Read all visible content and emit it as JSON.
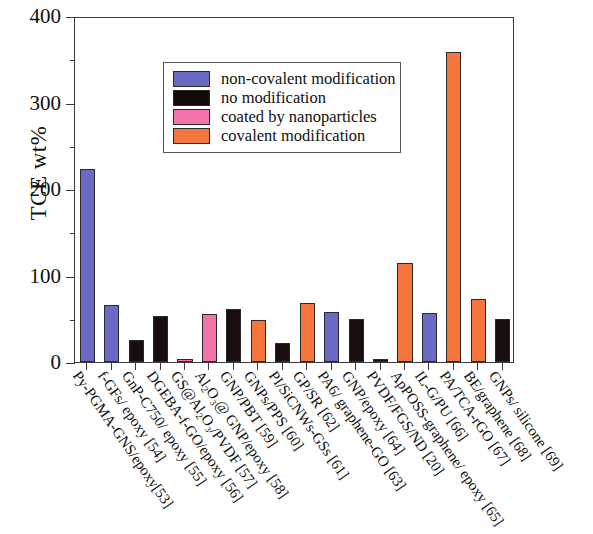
{
  "chart_data": {
    "type": "bar",
    "title": "",
    "xlabel": "",
    "ylabel": "TCE wt%",
    "ylim": [
      0,
      400
    ],
    "yticks": [
      0,
      100,
      200,
      300,
      400
    ],
    "ytick_labels": [
      "0",
      "100",
      "200",
      "300",
      "400"
    ],
    "grid": false,
    "legend_position": "upper-center",
    "categories": [
      "Py-PGMA-GNS/epoxy[53]",
      "f-GFs/ epoxy [54]",
      "GnP-C750/ epoxy [55]",
      "DGEBA-f-GO/epoxy [56]",
      "GS@Al2O3/PVDF [57]",
      "Al2O3@ GNP/epoxy [58]",
      "GNP/PBT [59]",
      "GNPs/PPS [60]",
      "PI/SiCNWs-GSs [61]",
      "GP/SR [62]",
      "PA6/ graphene-GO [63]",
      "GNP/epoxy [64]",
      "PVDF/FGS/ND [20]",
      "ApPOSS-graphene/ epoxy [65]",
      "IL-G/PU [66]",
      "PA/TCA-rGO [67]",
      "BE/graphene [68]",
      "GNPs/ silicone [69]"
    ],
    "bars": [
      {
        "label": "Py-PGMA-GNS/epoxy[53]",
        "value": 223,
        "group": "non-covalent modification"
      },
      {
        "label": "f-GFs/ epoxy [54]",
        "value": 66,
        "group": "non-covalent modification"
      },
      {
        "label": "GnP-C750/ epoxy [55]",
        "value": 25,
        "group": "no modification"
      },
      {
        "label": "DGEBA-f-GO/epoxy [56]",
        "value": 53,
        "group": "no modification"
      },
      {
        "label": "GS@Al2O3/PVDF [57]",
        "value": 4,
        "group": "coated by nanoparticles"
      },
      {
        "label": "Al2O3@ GNP/epoxy [58]",
        "value": 56,
        "group": "coated by nanoparticles"
      },
      {
        "label": "GNP/PBT [59]",
        "value": 61,
        "group": "no modification"
      },
      {
        "label": "GNPs/PPS [60]",
        "value": 49,
        "group": "covalent modification"
      },
      {
        "label": "PI/SiCNWs-GSs [61]",
        "value": 22,
        "group": "no modification"
      },
      {
        "label": "GP/SR [62]",
        "value": 68,
        "group": "covalent modification"
      },
      {
        "label": "PA6/ graphene-GO [63]",
        "value": 58,
        "group": "non-covalent modification"
      },
      {
        "label": "GNP/epoxy [64]",
        "value": 50,
        "group": "no modification"
      },
      {
        "label": "PVDF/FGS/ND [20]",
        "value": 4,
        "group": "no modification"
      },
      {
        "label": "ApPOSS-graphene/ epoxy [65]",
        "value": 115,
        "group": "covalent modification"
      },
      {
        "label": "IL-G/PU [66]",
        "value": 57,
        "group": "non-covalent modification"
      },
      {
        "label": "PA/TCA-rGO [67]",
        "value": 358,
        "group": "covalent modification"
      },
      {
        "label": "BE/graphene [68]",
        "value": 73,
        "group": "covalent modification"
      },
      {
        "label": "GNPs/ silicone [69]",
        "value": 50,
        "group": "no modification"
      }
    ],
    "series": [
      {
        "name": "non-covalent modification",
        "color": "#6a6ac4",
        "values": [
          223,
          66,
          null,
          null,
          null,
          null,
          null,
          null,
          null,
          null,
          58,
          null,
          null,
          null,
          57,
          null,
          null,
          null
        ]
      },
      {
        "name": "no modification",
        "color": "#1a0d0d",
        "values": [
          null,
          null,
          25,
          53,
          null,
          null,
          61,
          null,
          22,
          null,
          null,
          50,
          4,
          null,
          null,
          null,
          null,
          50
        ]
      },
      {
        "name": "coated by nanoparticles",
        "color": "#f573ab",
        "values": [
          null,
          null,
          null,
          null,
          4,
          56,
          null,
          null,
          null,
          null,
          null,
          null,
          null,
          null,
          null,
          null,
          null,
          null
        ]
      },
      {
        "name": "covalent modification",
        "color": "#f4763c",
        "values": [
          null,
          null,
          null,
          null,
          null,
          null,
          null,
          49,
          null,
          68,
          null,
          null,
          null,
          115,
          null,
          358,
          73,
          null
        ]
      }
    ]
  },
  "axis": {
    "ylabel": "TCE wt%",
    "ytick_labels": [
      "400",
      "300",
      "200",
      "100",
      "0"
    ]
  },
  "legend": {
    "items": [
      {
        "label": "non-covalent modification",
        "color": "#6a6ac4"
      },
      {
        "label": "no modification",
        "color": "#150a0a"
      },
      {
        "label": "coated by nanoparticles",
        "color": "#f573ab"
      },
      {
        "label": "covalent modification",
        "color": "#f4763c"
      }
    ]
  },
  "xlabels": [
    {
      "pre": "Py-PGMA-GNS/epoxy[53]",
      "sub": "",
      "post": ""
    },
    {
      "pre": "f-GFs/ epoxy [54]",
      "sub": "",
      "post": ""
    },
    {
      "pre": "GnP-C750/ epoxy [55]",
      "sub": "",
      "post": ""
    },
    {
      "pre": "DGEBA-f-GO/epoxy [56]",
      "sub": "",
      "post": ""
    },
    {
      "pre": "GS@Al",
      "sub": "2",
      "post": "O₃/PVDF [57]"
    },
    {
      "pre": "Al",
      "sub": "2",
      "post": "O₃@ GNP/epoxy [58]"
    },
    {
      "pre": "GNP/PBT [59]",
      "sub": "",
      "post": ""
    },
    {
      "pre": "GNPs/PPS [60]",
      "sub": "",
      "post": ""
    },
    {
      "pre": "PI/SiCNWs-GSs [61]",
      "sub": "",
      "post": ""
    },
    {
      "pre": "GP/SR [62]",
      "sub": "",
      "post": ""
    },
    {
      "pre": "PA6/ graphene-GO [63]",
      "sub": "",
      "post": ""
    },
    {
      "pre": "GNP/epoxy [64]",
      "sub": "",
      "post": ""
    },
    {
      "pre": "PVDF/FGS/ND [20]",
      "sub": "",
      "post": ""
    },
    {
      "pre": "ApPOSS-graphene/ epoxy [65]",
      "sub": "",
      "post": ""
    },
    {
      "pre": "IL-G/PU [66]",
      "sub": "",
      "post": ""
    },
    {
      "pre": "PA/TCA-rGO [67]",
      "sub": "",
      "post": ""
    },
    {
      "pre": "BE/graphene [68]",
      "sub": "",
      "post": ""
    },
    {
      "pre": "GNPs/ silicone [69]",
      "sub": "",
      "post": ""
    }
  ]
}
